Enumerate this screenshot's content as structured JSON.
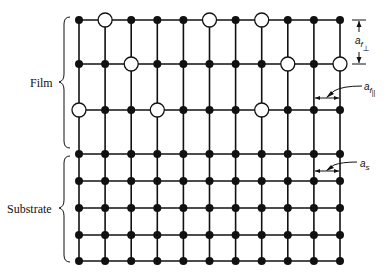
{
  "colors": {
    "line": "#111111",
    "atom_filled": "#111111",
    "atom_open_fill": "#ffffff",
    "background": "#ffffff"
  },
  "labels": {
    "film": "Film",
    "substrate": "Substrate",
    "a_f_perp": {
      "base": "a",
      "sub": "f",
      "subsub": "⊥"
    },
    "a_f_par": {
      "base": "a",
      "sub": "f",
      "subsub": "||"
    },
    "a_s": {
      "base": "a",
      "sub": "s"
    }
  },
  "lattice": {
    "columns": 11,
    "film_rows": [
      [
        "filled",
        "open",
        "filled",
        "filled",
        "filled",
        "open",
        "filled",
        "open",
        "filled",
        "filled",
        "filled"
      ],
      [
        "filled",
        "filled",
        "open",
        "filled",
        "filled",
        "filled",
        "filled",
        "filled",
        "open",
        "filled",
        "open"
      ],
      [
        "open",
        "filled",
        "filled",
        "open",
        "filled",
        "filled",
        "filled",
        "open",
        "filled",
        "filled",
        "filled"
      ]
    ],
    "substrate_rows": [
      [
        "filled",
        "filled",
        "filled",
        "filled",
        "filled",
        "filled",
        "filled",
        "filled",
        "filled",
        "filled",
        "filled"
      ],
      [
        "filled",
        "filled",
        "filled",
        "filled",
        "filled",
        "filled",
        "filled",
        "filled",
        "filled",
        "filled",
        "filled"
      ],
      [
        "filled",
        "filled",
        "filled",
        "filled",
        "filled",
        "filled",
        "filled",
        "filled",
        "filled",
        "filled",
        "filled"
      ],
      [
        "filled",
        "filled",
        "filled",
        "filled",
        "filled",
        "filled",
        "filled",
        "filled",
        "filled",
        "filled",
        "filled"
      ],
      [
        "filled",
        "filled",
        "filled",
        "filled",
        "filled",
        "filled",
        "filled",
        "filled",
        "filled",
        "filled",
        "filled"
      ]
    ]
  }
}
